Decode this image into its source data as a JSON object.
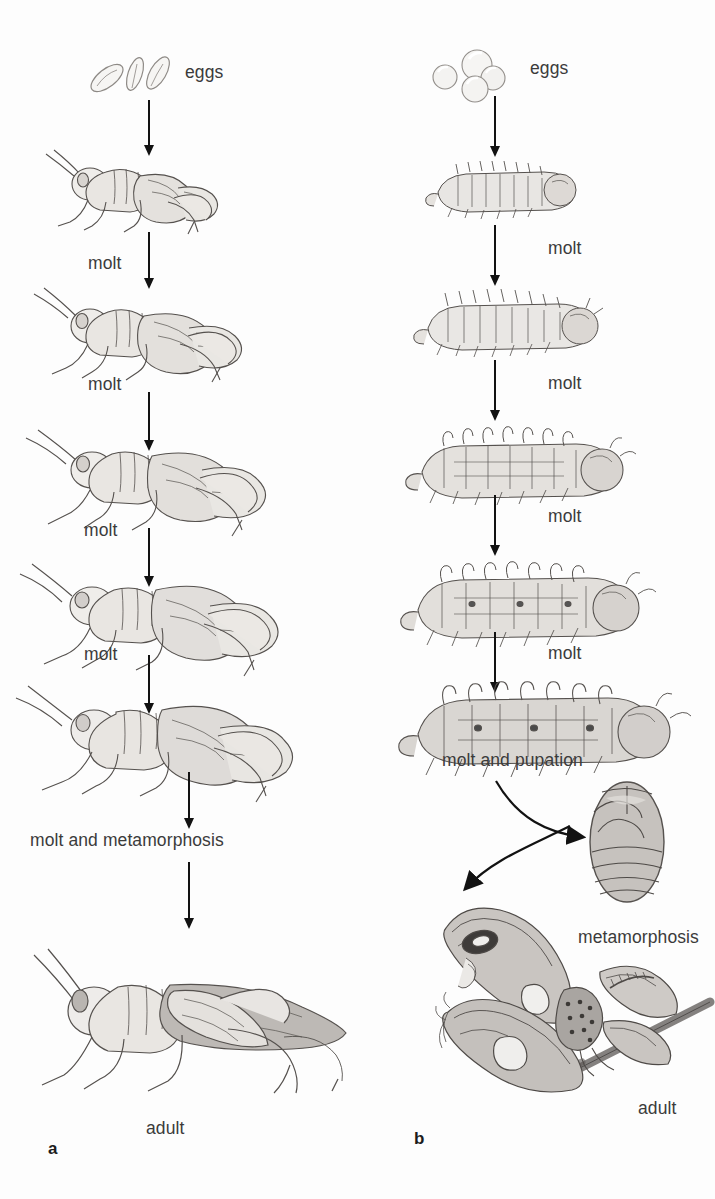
{
  "figure": {
    "background_color": "#fdfdfd",
    "text_color": "#3b3b3b",
    "arrow_color": "#121212",
    "width": 715,
    "height": 1199
  },
  "panel_a": {
    "letter": "a",
    "subject": "grasshopper",
    "metamorphosis_type": "incomplete",
    "stages": [
      {
        "name": "eggs",
        "label": "eggs",
        "kind": "eggs-elongate",
        "count": 3
      },
      {
        "name": "first-instar",
        "label": "",
        "kind": "nymph",
        "instar": 1
      },
      {
        "name": "second-instar",
        "label": "",
        "kind": "nymph",
        "instar": 2
      },
      {
        "name": "third-instar",
        "label": "",
        "kind": "nymph",
        "instar": 3
      },
      {
        "name": "fourth-instar",
        "label": "",
        "kind": "nymph",
        "instar": 4
      },
      {
        "name": "fifth-instar",
        "label": "",
        "kind": "nymph",
        "instar": 5
      },
      {
        "name": "adult",
        "label": "adult",
        "kind": "adult-grasshopper"
      }
    ],
    "transitions": [
      {
        "label": "",
        "from": "eggs",
        "to": "first-instar"
      },
      {
        "label": "molt",
        "from": "first-instar",
        "to": "second-instar"
      },
      {
        "label": "molt",
        "from": "second-instar",
        "to": "third-instar"
      },
      {
        "label": "molt",
        "from": "third-instar",
        "to": "fourth-instar"
      },
      {
        "label": "molt",
        "from": "fourth-instar",
        "to": "fifth-instar"
      },
      {
        "label": "molt and metamorphosis",
        "from": "fifth-instar",
        "to": "adult"
      }
    ]
  },
  "panel_b": {
    "letter": "b",
    "subject": "moth",
    "metamorphosis_type": "complete",
    "stages": [
      {
        "name": "eggs",
        "label": "eggs",
        "kind": "eggs-round",
        "count": 4
      },
      {
        "name": "first-larva",
        "label": "",
        "kind": "larva",
        "instar": 1
      },
      {
        "name": "second-larva",
        "label": "",
        "kind": "larva",
        "instar": 2
      },
      {
        "name": "third-larva",
        "label": "",
        "kind": "larva",
        "instar": 3
      },
      {
        "name": "fourth-larva",
        "label": "",
        "kind": "larva",
        "instar": 4
      },
      {
        "name": "fifth-larva",
        "label": "",
        "kind": "larva",
        "instar": 5
      },
      {
        "name": "pupa",
        "label": "",
        "kind": "pupa"
      },
      {
        "name": "adult",
        "label": "adult",
        "kind": "adult-moth"
      }
    ],
    "transitions": [
      {
        "label": "",
        "from": "eggs",
        "to": "first-larva"
      },
      {
        "label": "molt",
        "from": "first-larva",
        "to": "second-larva"
      },
      {
        "label": "molt",
        "from": "second-larva",
        "to": "third-larva"
      },
      {
        "label": "molt",
        "from": "third-larva",
        "to": "fourth-larva"
      },
      {
        "label": "molt",
        "from": "fourth-larva",
        "to": "fifth-larva"
      },
      {
        "label": "molt and pupation",
        "from": "fifth-larva",
        "to": "pupa"
      },
      {
        "label": "metamorphosis",
        "from": "pupa",
        "to": "adult"
      }
    ]
  },
  "labels": {
    "a_eggs": "eggs",
    "a_molt_1": "molt",
    "a_molt_2": "molt",
    "a_molt_3": "molt",
    "a_molt_4": "molt",
    "a_molt_metamorphosis": "molt and metamorphosis",
    "a_adult": "adult",
    "a_letter": "a",
    "b_eggs": "eggs",
    "b_molt_1": "molt",
    "b_molt_2": "molt",
    "b_molt_3": "molt",
    "b_molt_4": "molt",
    "b_molt_pupation": "molt and pupation",
    "b_metamorphosis": "metamorphosis",
    "b_adult": "adult",
    "b_letter": "b"
  }
}
